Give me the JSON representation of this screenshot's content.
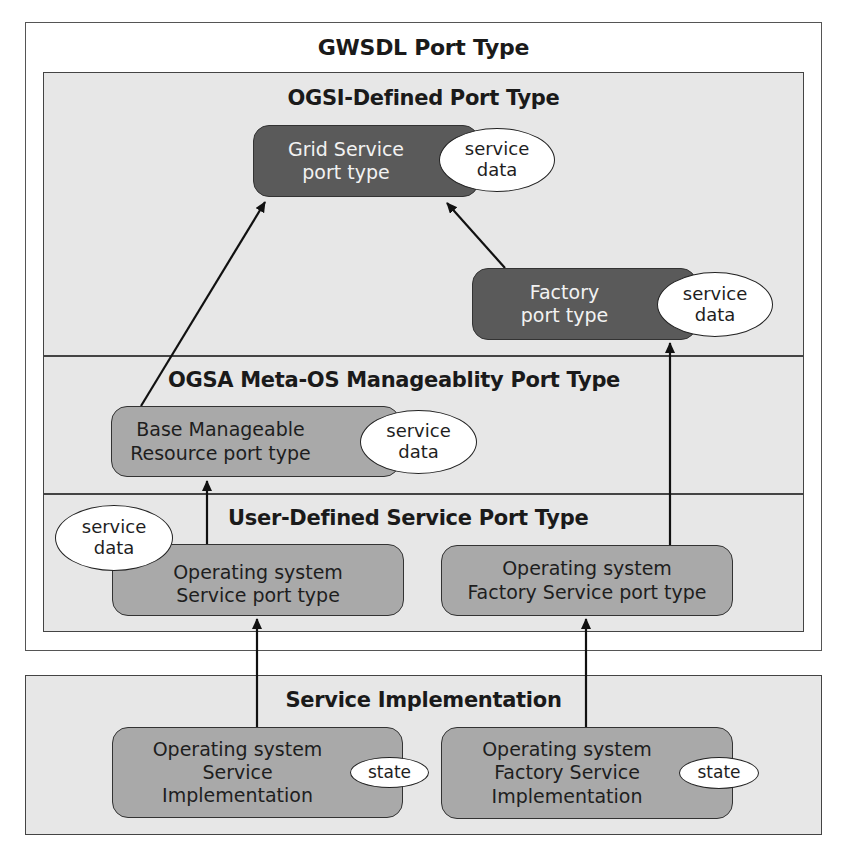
{
  "gwsdl": {
    "title": "GWSDL Port Type"
  },
  "ogsi": {
    "title": "OGSI-Defined Port Type",
    "grid_service": {
      "line1": "Grid Service",
      "line2": "port type",
      "oval": {
        "line1": "service",
        "line2": "data"
      }
    },
    "factory": {
      "line1": "Factory",
      "line2": "port type",
      "oval": {
        "line1": "service",
        "line2": "data"
      }
    }
  },
  "ogsa": {
    "title": "OGSA Meta-OS Manageablity Port Type",
    "base": {
      "line1": "Base Manageable",
      "line2": "Resource port type",
      "oval": {
        "line1": "service",
        "line2": "data"
      }
    }
  },
  "user_defined": {
    "title": "User-Defined Service Port Type",
    "os_service": {
      "line1": "Operating system",
      "line2": "Service port type",
      "oval": {
        "line1": "service",
        "line2": "data"
      }
    },
    "os_factory": {
      "line1": "Operating system",
      "line2": "Factory Service port type"
    }
  },
  "implementation": {
    "title": "Service Implementation",
    "os_service_impl": {
      "line1": "Operating system",
      "line2": "Service",
      "line3": "Implementation",
      "oval": "state"
    },
    "os_factory_impl": {
      "line1": "Operating system",
      "line2": "Factory Service",
      "line3": "Implementation",
      "oval": "state"
    }
  },
  "colors": {
    "dark_box": "#5a5a5a",
    "mid_box": "#a9a9a9",
    "frame_gray": "#e7e7e7",
    "line": "#222222"
  }
}
